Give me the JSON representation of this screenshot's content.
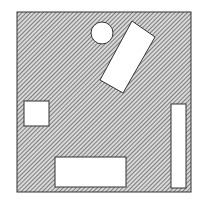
{
  "canvas": {
    "width": 205,
    "height": 205,
    "background": "#ffffff"
  },
  "colors": {
    "hatch": "#555555",
    "hatch_bg": "#d8d8d8",
    "outline": "#333333",
    "shape_fill": "#ffffff"
  },
  "diagram": {
    "field": {
      "x": 17,
      "y": 12,
      "width": 174,
      "height": 180
    },
    "shapes": [
      {
        "type": "circle",
        "name": "circle",
        "cx": 102,
        "cy": 33,
        "r": 11
      },
      {
        "type": "polygon",
        "name": "rotated-rectangle",
        "points": "132,21 155,37 123,93 100,80"
      },
      {
        "type": "rect",
        "name": "small-square",
        "x": 24,
        "y": 101,
        "width": 25,
        "height": 25
      },
      {
        "type": "rect",
        "name": "tall-rectangle",
        "x": 171,
        "y": 104,
        "width": 15,
        "height": 84
      },
      {
        "type": "rect",
        "name": "wide-rectangle",
        "x": 55,
        "y": 157,
        "width": 71,
        "height": 30
      }
    ]
  }
}
